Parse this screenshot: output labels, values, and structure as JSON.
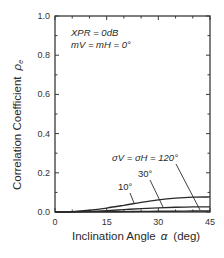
{
  "chart_data": {
    "type": "line",
    "title": "",
    "xlabel": "Inclination Angle  α  (deg)",
    "ylabel": "Correlation Coefficient  ρe",
    "xlim": [
      0,
      45
    ],
    "ylim": [
      0.0,
      1.0
    ],
    "x_ticks": [
      "0",
      "15",
      "30",
      "45"
    ],
    "y_ticks": [
      "0.0",
      "0.2",
      "0.4",
      "0.6",
      "0.8",
      "1.0"
    ],
    "grid": false,
    "annotations": [
      "XPR = 0dB",
      "mV = mH = 0°",
      "σV = σH = 120°",
      "30°",
      "10°"
    ],
    "x": [
      0,
      5,
      10,
      15,
      20,
      25,
      30,
      35,
      40,
      45
    ],
    "series": [
      {
        "name": "σV = σH = 10°",
        "values": [
          0.0,
          0.002,
          0.009,
          0.02,
          0.034,
          0.049,
          0.062,
          0.071,
          0.076,
          0.077
        ]
      },
      {
        "name": "σV = σH = 30°",
        "values": [
          0.0,
          0.001,
          0.003,
          0.007,
          0.012,
          0.017,
          0.021,
          0.024,
          0.026,
          0.026
        ]
      },
      {
        "name": "σV = σH = 120°",
        "values": [
          0.0,
          0.0,
          0.001,
          0.001,
          0.002,
          0.003,
          0.004,
          0.004,
          0.005,
          0.005
        ]
      }
    ]
  },
  "labels": {
    "xlabel_text": "Inclination Angle",
    "xlabel_symbol": "α",
    "xlabel_unit": "(deg)",
    "ylabel_text": "Correlation Coefficient",
    "ylabel_symbol": "ρ",
    "ylabel_sub": "e",
    "xpr": "XPR = 0dB",
    "m_line": "mV = mH = 0°",
    "sigma_120": "σV = σH = 120°",
    "sigma_30": "30°",
    "sigma_10": "10°"
  },
  "colors": {
    "line": "#2a2a2a",
    "frame": "#3a3a3a"
  }
}
